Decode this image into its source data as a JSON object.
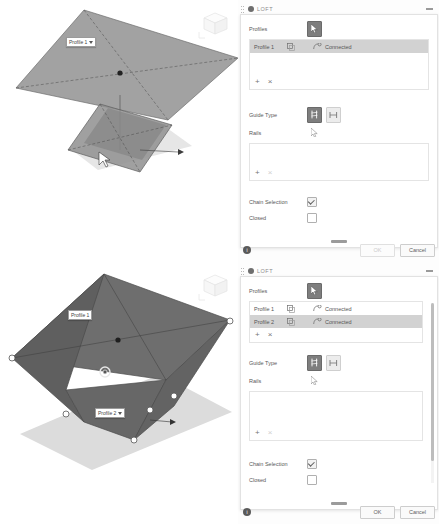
{
  "app": {
    "dialog_title": "LOFT"
  },
  "shots": [
    {
      "id": "top",
      "viewport": {
        "labels": [
          {
            "text": "Profile 1",
            "has_dropdown": true
          }
        ]
      },
      "dialog": {
        "title": "LOFT",
        "profiles_label": "Profiles",
        "guide_type_label": "Guide Type",
        "rails_label": "Rails",
        "chain_selection_label": "Chain Selection",
        "closed_label": "Closed",
        "chain_selection_checked": true,
        "closed_checked": false,
        "profiles": [
          {
            "name": "Profile 1",
            "connection": "Connected",
            "selected": true
          }
        ],
        "rails": [],
        "add_label": "+",
        "remove_label": "×",
        "ok_label": "OK",
        "cancel_label": "Cancel",
        "ok_enabled": false
      }
    },
    {
      "id": "bottom",
      "viewport": {
        "labels": [
          {
            "text": "Profile 1",
            "has_dropdown": false
          },
          {
            "text": "Profile 2",
            "has_dropdown": true
          }
        ]
      },
      "dialog": {
        "title": "LOFT",
        "profiles_label": "Profiles",
        "guide_type_label": "Guide Type",
        "rails_label": "Rails",
        "chain_selection_label": "Chain Selection",
        "closed_label": "Closed",
        "chain_selection_checked": true,
        "closed_checked": false,
        "profiles": [
          {
            "name": "Profile 1",
            "connection": "Connected",
            "selected": false
          },
          {
            "name": "Profile 2",
            "connection": "Connected",
            "selected": true
          }
        ],
        "rails": [],
        "add_label": "+",
        "remove_label": "×",
        "ok_label": "OK",
        "cancel_label": "Cancel",
        "ok_enabled": true
      }
    }
  ],
  "colors": {
    "selection_highlight": "#d2d2d2",
    "profile_face": "#8d8d8d",
    "loft_body": "#6a6a6a",
    "shadow": "#d8d8d8",
    "pick_button_active": "#7e7e7e"
  }
}
